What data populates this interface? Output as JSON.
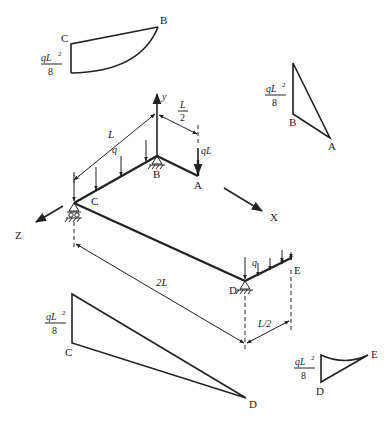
{
  "figure": {
    "type": "space frame bending moment diagram",
    "axes": {
      "x": "X",
      "y": "y",
      "z": "Z"
    },
    "nodes": [
      "A",
      "B",
      "C",
      "D",
      "E"
    ],
    "loads": {
      "distributed_label": "q",
      "point_label": "qL",
      "point_load_at": "A"
    },
    "dimensions": {
      "BC": "L",
      "BA": "L/2",
      "BA_fraction_num": "L",
      "BA_fraction_den": "2",
      "CD": "2L",
      "DE": "L/2"
    }
  },
  "moment_diagrams": [
    {
      "member": "CB",
      "end_labels": [
        "C",
        "B"
      ],
      "value_num": "qL²",
      "value_num_base": "qL",
      "value_num_exp": "2",
      "value_den": "8",
      "shape": "parabolic + linear"
    },
    {
      "member": "BA",
      "end_labels": [
        "B",
        "A"
      ],
      "value_num_base": "qL",
      "value_num_exp": "2",
      "value_den": "8",
      "shape": "triangular"
    },
    {
      "member": "CD",
      "end_labels": [
        "C",
        "D"
      ],
      "value_num_base": "qL",
      "value_num_exp": "2",
      "value_den": "8",
      "shape": "triangular"
    },
    {
      "member": "DE",
      "end_labels": [
        "D",
        "E"
      ],
      "value_num_base": "qL",
      "value_num_exp": "2",
      "value_den": "8",
      "shape": "parabolic"
    }
  ],
  "labels": {
    "A": "A",
    "B": "B",
    "C": "C",
    "D": "D",
    "E": "E",
    "X": "X",
    "Y": "y",
    "Z": "Z",
    "q": "q",
    "qL": "qL",
    "L": "L",
    "L_num": "L",
    "L_den": "2",
    "twoL": "2L",
    "L_half": "L/2",
    "sup2": "2",
    "eight": "8"
  }
}
